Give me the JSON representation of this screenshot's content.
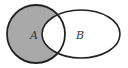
{
  "diagram": {
    "type": "venn",
    "sets": [
      {
        "id": "A",
        "label": "A",
        "shape": "circle",
        "cx": 36,
        "cy": 34,
        "r": 29
      },
      {
        "id": "B",
        "label": "B",
        "shape": "ellipse",
        "cx": 81,
        "cy": 34,
        "rx": 39,
        "ry": 24
      }
    ],
    "shaded_region": "A-B",
    "colors": {
      "fill": "#a9a9a9",
      "stroke": "#222222",
      "background": "#ffffff",
      "label": "#333333"
    }
  }
}
